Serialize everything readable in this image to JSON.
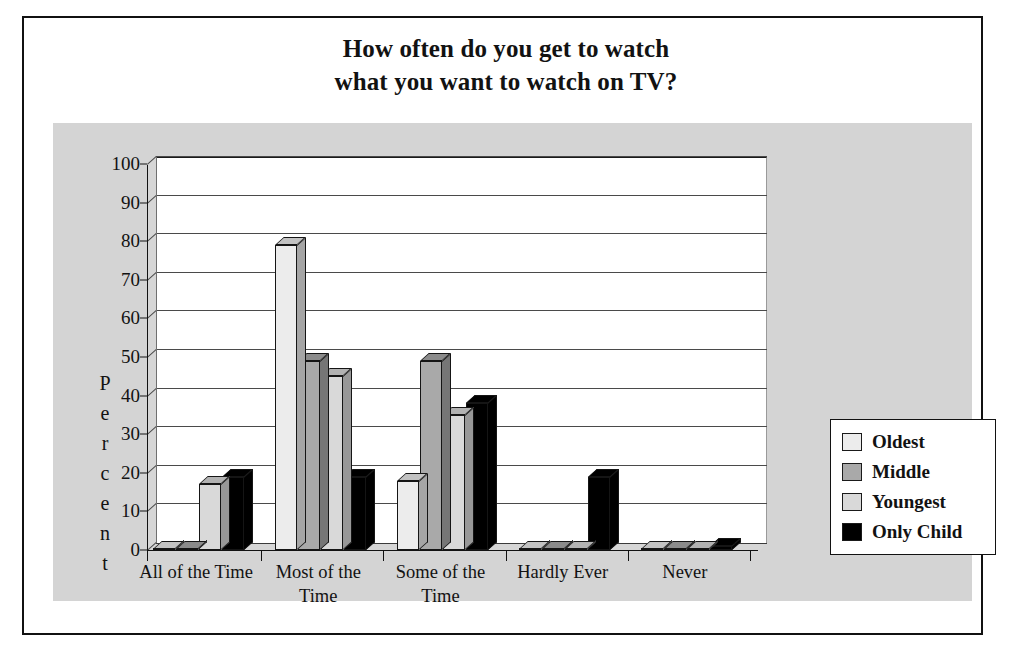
{
  "figure": {
    "title_line_1": "How often do you get to watch",
    "title_line_2": "what you want to watch on TV?"
  },
  "legend": {
    "position": "right",
    "entries": [
      {
        "label": "Oldest",
        "color": "#ececec"
      },
      {
        "label": "Middle",
        "color": "#a9a9a9"
      },
      {
        "label": "Youngest",
        "color": "#d9d9d9"
      },
      {
        "label": "Only Child",
        "color": "#000000"
      }
    ]
  },
  "axes": {
    "ylabel_letters": [
      "P",
      "e",
      "r",
      "c",
      "e",
      "n",
      "t"
    ],
    "ylabel": "Percent",
    "yticks": [
      100,
      90,
      80,
      70,
      60,
      50,
      40,
      30,
      20,
      10,
      0
    ],
    "ylim": [
      0,
      100
    ],
    "grid": true
  },
  "chart_data": {
    "type": "bar",
    "title": "How often do you get to watch what you want to watch on TV?",
    "xlabel": "",
    "ylabel": "Percent",
    "ylim": [
      0,
      100
    ],
    "grid": true,
    "legend_position": "right",
    "categories": [
      "All of the Time",
      "Most of the\nTime",
      "Some of the\nTime",
      "Hardly Ever",
      "Never"
    ],
    "series": [
      {
        "name": "Oldest",
        "color": "#ececec",
        "values": [
          0,
          79,
          18,
          0,
          0
        ]
      },
      {
        "name": "Middle",
        "color": "#a9a9a9",
        "values": [
          0,
          49,
          49,
          0,
          0
        ]
      },
      {
        "name": "Youngest",
        "color": "#d9d9d9",
        "values": [
          17,
          45,
          35,
          0,
          0
        ]
      },
      {
        "name": "Only Child",
        "color": "#000000",
        "values": [
          19,
          19,
          38,
          19,
          1
        ]
      }
    ]
  }
}
